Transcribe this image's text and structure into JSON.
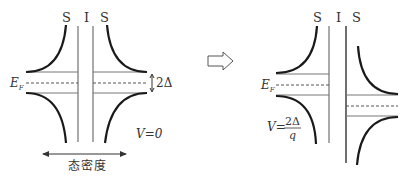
{
  "left_panel": {
    "labels": {
      "s_left": "S",
      "i": "I",
      "s_right": "S"
    },
    "fermi_label": "E",
    "fermi_sub": "F",
    "gap_label": "2Δ",
    "voltage_label": "V=0",
    "axis_label": "态密度"
  },
  "arrow": {
    "direction": "right",
    "style": "hollow"
  },
  "right_panel": {
    "labels": {
      "s_left": "S",
      "i": "I",
      "s_right": "S"
    },
    "fermi_label": "E",
    "fermi_sub": "F",
    "voltage_label_prefix": "V=",
    "voltage_numerator": "2Δ",
    "voltage_denominator": "q"
  },
  "colors": {
    "curve": "#1a1a1a",
    "line": "#555555",
    "text": "#333333"
  }
}
